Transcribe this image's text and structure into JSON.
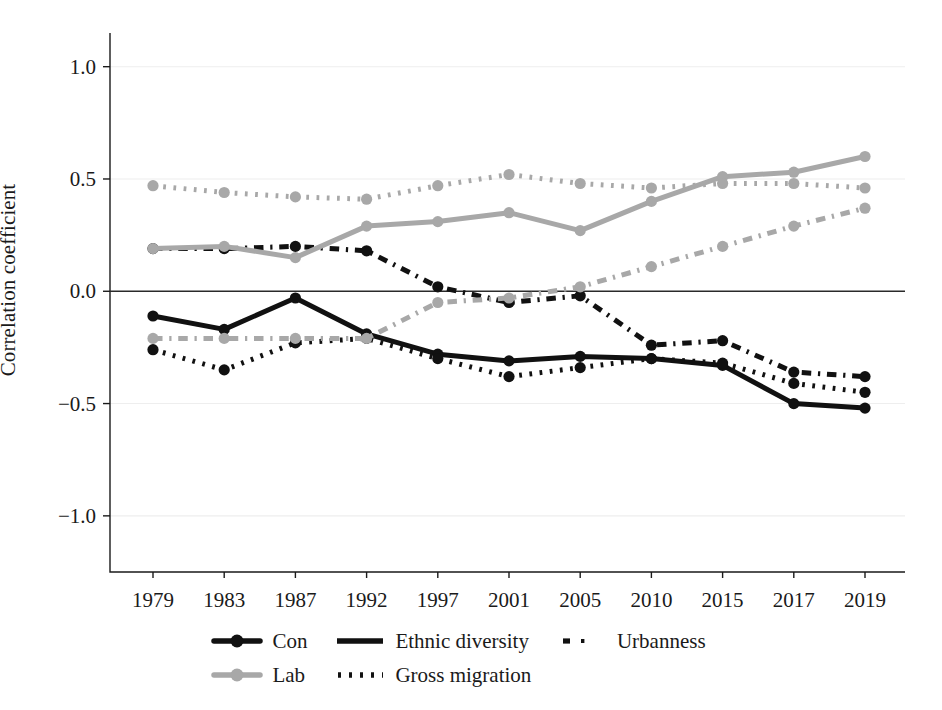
{
  "chart_data": {
    "type": "line",
    "title": "",
    "xlabel": "",
    "ylabel": "Correlation coefficient",
    "categories": [
      "1979",
      "1983",
      "1987",
      "1992",
      "1997",
      "2001",
      "2005",
      "2010",
      "2015",
      "2017",
      "2019"
    ],
    "ylim": [
      -1.25,
      1.15
    ],
    "yticks": [
      1.0,
      0.5,
      0.0,
      -0.5,
      -1.0
    ],
    "ytick_labels": [
      "1.0",
      "0.5",
      "0.0",
      "−0.5",
      "−1.0"
    ],
    "grid": "horizontal-light",
    "zero_line": true,
    "legend_position": "bottom",
    "series": [
      {
        "name": "Con × Ethnic diversity",
        "party": "Con",
        "measure": "Ethnic diversity",
        "color": "#111111",
        "style": "solid",
        "values": [
          -0.11,
          -0.17,
          -0.03,
          -0.19,
          -0.28,
          -0.31,
          -0.29,
          -0.3,
          -0.33,
          -0.5,
          -0.52
        ]
      },
      {
        "name": "Con × Gross migration",
        "party": "Con",
        "measure": "Gross migration",
        "color": "#111111",
        "style": "dotted",
        "values": [
          -0.26,
          -0.35,
          -0.23,
          -0.21,
          -0.3,
          -0.38,
          -0.34,
          -0.3,
          -0.32,
          -0.41,
          -0.45
        ]
      },
      {
        "name": "Con × Urbanness",
        "party": "Con",
        "measure": "Urbanness",
        "color": "#111111",
        "style": "dashdot",
        "values": [
          0.19,
          0.19,
          0.2,
          0.18,
          0.02,
          -0.05,
          -0.02,
          -0.24,
          -0.22,
          -0.36,
          -0.38
        ]
      },
      {
        "name": "Lab × Ethnic diversity",
        "party": "Lab",
        "measure": "Ethnic diversity",
        "color": "#a8a8a8",
        "style": "solid",
        "values": [
          0.19,
          0.2,
          0.15,
          0.29,
          0.31,
          0.35,
          0.27,
          0.4,
          0.51,
          0.53,
          0.6
        ]
      },
      {
        "name": "Lab × Gross migration",
        "party": "Lab",
        "measure": "Gross migration",
        "color": "#a8a8a8",
        "style": "dashdot",
        "values": [
          -0.21,
          -0.21,
          -0.21,
          -0.21,
          -0.05,
          -0.03,
          0.02,
          0.11,
          0.2,
          0.29,
          0.37
        ]
      },
      {
        "name": "Lab × Urbanness",
        "party": "Lab",
        "measure": "Urbanness",
        "color": "#a8a8a8",
        "style": "dotted",
        "values": [
          0.47,
          0.44,
          0.42,
          0.41,
          0.47,
          0.52,
          0.48,
          0.46,
          0.48,
          0.48,
          0.46
        ]
      }
    ]
  },
  "legend": {
    "rows": [
      [
        {
          "label": "Con",
          "kind": "marker-line",
          "color": "#111111"
        },
        {
          "label": "Ethnic diversity",
          "kind": "solid",
          "color": "#111111"
        },
        {
          "label": "Urbanness",
          "kind": "dashdot",
          "color": "#111111"
        }
      ],
      [
        {
          "label": "Lab",
          "kind": "marker-line",
          "color": "#a8a8a8"
        },
        {
          "label": "Gross migration",
          "kind": "dotted",
          "color": "#111111"
        }
      ]
    ]
  },
  "colors": {
    "con": "#111111",
    "lab": "#a8a8a8",
    "axis": "#1a1a1a",
    "grid": "#eeeeee",
    "background": "#ffffff"
  }
}
